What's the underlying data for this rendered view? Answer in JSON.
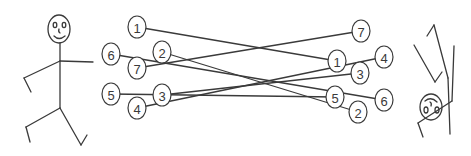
{
  "diagram": {
    "type": "matching-diagram",
    "left_figure": {
      "name": "standing-stick-figure",
      "face": "smiling"
    },
    "right_figure": {
      "name": "upside-down-stick-figure",
      "face": "smiling-inverted"
    },
    "left_nodes": [
      {
        "label": "1",
        "x": 137,
        "y": 27
      },
      {
        "label": "6",
        "x": 111,
        "y": 54
      },
      {
        "label": "2",
        "x": 162,
        "y": 52
      },
      {
        "label": "7",
        "x": 137,
        "y": 68
      },
      {
        "label": "5",
        "x": 111,
        "y": 94
      },
      {
        "label": "3",
        "x": 162,
        "y": 95
      },
      {
        "label": "4",
        "x": 137,
        "y": 108
      }
    ],
    "right_nodes": [
      {
        "label": "7",
        "x": 361,
        "y": 31
      },
      {
        "label": "1",
        "x": 337,
        "y": 61
      },
      {
        "label": "4",
        "x": 384,
        "y": 57
      },
      {
        "label": "3",
        "x": 360,
        "y": 73
      },
      {
        "label": "5",
        "x": 335,
        "y": 97
      },
      {
        "label": "6",
        "x": 384,
        "y": 100
      },
      {
        "label": "2",
        "x": 358,
        "y": 112
      }
    ],
    "edges": [
      {
        "from": "L1",
        "to": "R1"
      },
      {
        "from": "L2",
        "to": "R2"
      },
      {
        "from": "L3",
        "to": "R3"
      },
      {
        "from": "L4",
        "to": "R4"
      },
      {
        "from": "L5",
        "to": "R5"
      },
      {
        "from": "L6",
        "to": "R6"
      },
      {
        "from": "L7",
        "to": "R7"
      }
    ]
  }
}
